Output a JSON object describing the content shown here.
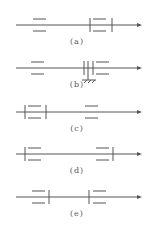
{
  "diagram": {
    "stroke_color": "#555555",
    "rows": [
      {
        "id": "a",
        "label": "(a)",
        "axis_y": 25,
        "label_y": 37
      },
      {
        "id": "b",
        "label": "(b)",
        "axis_y": 68,
        "label_y": 83
      },
      {
        "id": "c",
        "label": "(c)",
        "axis_y": 112,
        "label_y": 124
      },
      {
        "id": "d",
        "label": "(d)",
        "axis_y": 154,
        "label_y": 166
      },
      {
        "id": "e",
        "label": "(e)",
        "axis_y": 197,
        "label_y": 209
      }
    ]
  }
}
